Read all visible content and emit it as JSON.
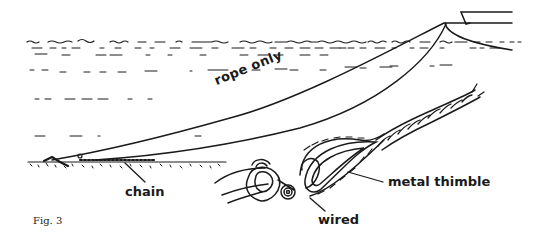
{
  "figure": {
    "caption": "Fig. 3",
    "labels": {
      "rope_only": "rope only",
      "chain": "chain",
      "metal_thimble": "metal thimble",
      "wired": "wired"
    },
    "colors": {
      "ink": "#1a1a1a",
      "background": "#ffffff"
    }
  }
}
